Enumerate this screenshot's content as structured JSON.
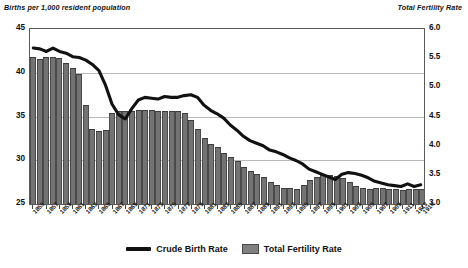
{
  "chart_data": {
    "type": "bar",
    "title": "",
    "subtitle": "",
    "ylabel": "Births per 1,000 resident population",
    "y2label": "Total Fertility Rate",
    "xlabel": "",
    "grid": true,
    "legend_position": "bottom",
    "ylim": [
      25,
      45
    ],
    "y2lim": [
      3.0,
      6.0
    ],
    "yticks": [
      "45",
      "40",
      "35",
      "30",
      "25"
    ],
    "y2ticks": [
      "6.0",
      "5.5",
      "5.0",
      "4.5",
      "4.0",
      "3.5",
      "3.0"
    ],
    "x": [
      1855,
      1856,
      1857,
      1858,
      1859,
      1860,
      1861,
      1862,
      1863,
      1864,
      1865,
      1866,
      1867,
      1868,
      1869,
      1870,
      1871,
      1872,
      1873,
      1874,
      1875,
      1876,
      1877,
      1878,
      1879,
      1880,
      1881,
      1882,
      1883,
      1884,
      1885,
      1886,
      1887,
      1888,
      1889,
      1890,
      1891,
      1892,
      1893,
      1894,
      1895,
      1896,
      1897,
      1898,
      1899,
      1900,
      1901,
      1902,
      1903,
      1904,
      1905,
      1906,
      1907,
      1908,
      1909,
      1910,
      1911,
      1912,
      1913,
      1914
    ],
    "xtick_labels": [
      "1855",
      "1857",
      "1859",
      "1861",
      "1863",
      "1865",
      "1867",
      "1869",
      "1871",
      "1873",
      "1875",
      "1877",
      "1879",
      "1881",
      "1883",
      "1885",
      "1887",
      "1889",
      "1891",
      "1893",
      "1895",
      "1897",
      "1899",
      "1901",
      "1903",
      "1905",
      "1907",
      "1909",
      "1911",
      "1913",
      "1914"
    ],
    "series": [
      {
        "name": "Total Fertility Rate",
        "type": "bar",
        "axis": "right",
        "color": "#737373",
        "values": [
          5.52,
          5.49,
          5.52,
          5.52,
          5.5,
          5.42,
          5.33,
          5.23,
          4.7,
          4.28,
          4.25,
          4.27,
          4.56,
          4.6,
          4.6,
          4.6,
          4.61,
          4.62,
          4.61,
          4.6,
          4.6,
          4.59,
          4.6,
          4.56,
          4.44,
          4.28,
          4.14,
          4.03,
          3.97,
          3.88,
          3.81,
          3.73,
          3.64,
          3.57,
          3.52,
          3.47,
          3.38,
          3.32,
          3.28,
          3.27,
          3.26,
          3.33,
          3.41,
          3.46,
          3.49,
          3.5,
          3.48,
          3.44,
          3.38,
          3.31,
          3.27,
          3.26,
          3.27,
          3.28,
          3.26,
          3.25,
          3.24,
          3.26,
          3.25,
          3.26
        ]
      },
      {
        "name": "Crude Birth Rate",
        "type": "line",
        "axis": "left",
        "color": "#111111",
        "values": [
          42.8,
          42.7,
          42.4,
          42.8,
          42.4,
          42.2,
          41.8,
          41.7,
          41.4,
          40.9,
          40.2,
          38.5,
          36.3,
          35.1,
          34.6,
          35.8,
          36.8,
          37.1,
          37.0,
          36.9,
          37.2,
          37.1,
          37.1,
          37.3,
          37.4,
          37.1,
          36.2,
          35.6,
          35.2,
          34.7,
          33.9,
          33.3,
          32.6,
          32.1,
          31.8,
          31.5,
          31.0,
          30.8,
          30.5,
          30.1,
          29.8,
          29.4,
          28.8,
          28.5,
          28.2,
          27.9,
          27.6,
          28.2,
          28.4,
          28.3,
          28.1,
          27.8,
          27.4,
          27.2,
          27.0,
          26.9,
          26.8,
          27.1,
          26.8,
          27.0
        ]
      }
    ]
  },
  "legend": {
    "items": [
      {
        "label": "Crude Birth Rate",
        "marker": "line"
      },
      {
        "label": "Total Fertility Rate",
        "marker": "bar"
      }
    ]
  },
  "colors": {
    "bar": "#737373",
    "line": "#111111",
    "grid": "#b9b9b9",
    "frame": "#5a5a5a",
    "background": "#ffffff"
  }
}
